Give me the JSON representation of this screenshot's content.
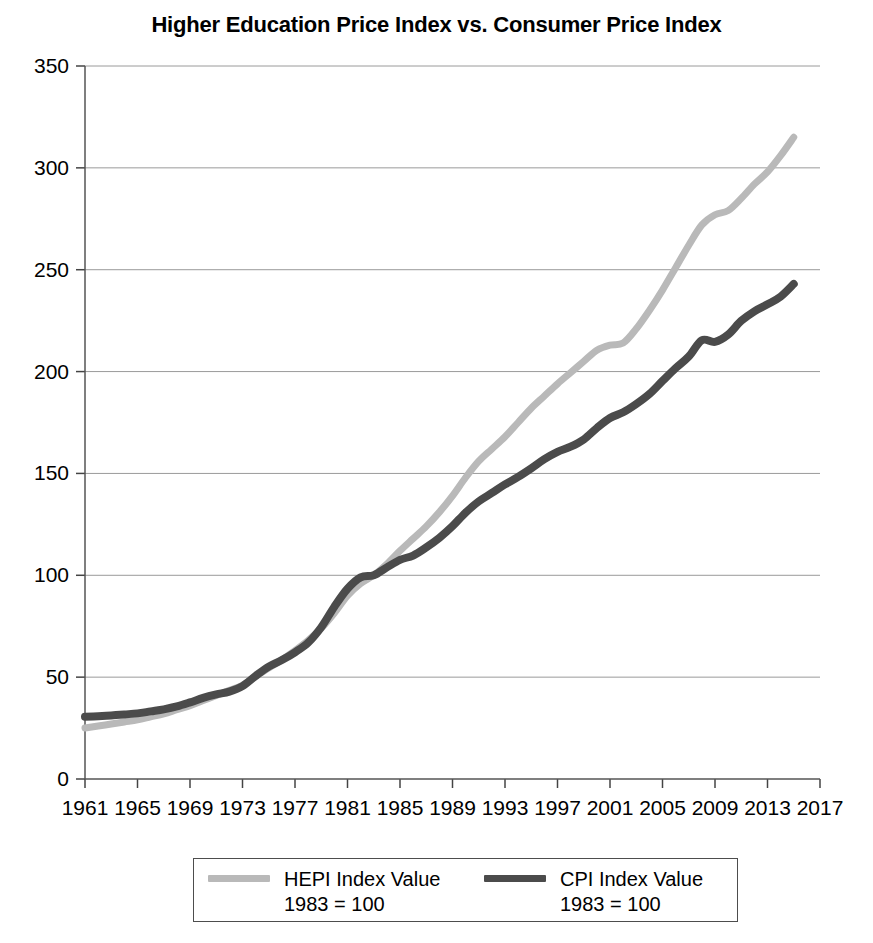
{
  "chart_data": {
    "type": "line",
    "title": "Higher Education Price Index vs. Consumer Price Index",
    "xlabel": "",
    "ylabel": "",
    "xlim": [
      1961,
      2017
    ],
    "ylim": [
      0,
      350
    ],
    "grid": true,
    "legend_position": "bottom",
    "ytick_labels": [
      "0",
      "50",
      "100",
      "150",
      "200",
      "250",
      "300",
      "350"
    ],
    "ytick_values": [
      0,
      50,
      100,
      150,
      200,
      250,
      300,
      350
    ],
    "xtick_labels": [
      "1961",
      "1965",
      "1969",
      "1973",
      "1977",
      "1981",
      "1985",
      "1989",
      "1993",
      "1997",
      "2001",
      "2005",
      "2009",
      "2013",
      "2017"
    ],
    "xtick_values": [
      1961,
      1965,
      1969,
      1973,
      1977,
      1981,
      1985,
      1989,
      1993,
      1997,
      2001,
      2005,
      2009,
      2013,
      2017
    ],
    "x": [
      1961,
      1962,
      1963,
      1964,
      1965,
      1966,
      1967,
      1968,
      1969,
      1970,
      1971,
      1972,
      1973,
      1974,
      1975,
      1976,
      1977,
      1978,
      1979,
      1980,
      1981,
      1982,
      1983,
      1984,
      1985,
      1986,
      1987,
      1988,
      1989,
      1990,
      1991,
      1992,
      1993,
      1994,
      1995,
      1996,
      1997,
      1998,
      1999,
      2000,
      2001,
      2002,
      2003,
      2004,
      2005,
      2006,
      2007,
      2008,
      2009,
      2010,
      2011,
      2012,
      2013,
      2014,
      2015
    ],
    "series": [
      {
        "name": "HEPI Index Value",
        "sublabel": "1983 = 100",
        "color": "#b9b9b9",
        "values": [
          25.0,
          26.0,
          27.0,
          28.0,
          29.0,
          30.5,
          32.0,
          34.0,
          36.0,
          38.5,
          41.0,
          43.5,
          46.0,
          50.5,
          54.5,
          58.5,
          63.0,
          68.0,
          74.0,
          81.5,
          90.0,
          96.0,
          100.0,
          105.5,
          112.0,
          118.0,
          124.0,
          131.0,
          139.0,
          148.0,
          156.0,
          162.0,
          168.0,
          175.0,
          182.0,
          188.0,
          194.0,
          199.5,
          205.0,
          210.5,
          213.0,
          214.0,
          221.0,
          230.0,
          240.0,
          251.0,
          262.0,
          272.0,
          277.0,
          279.0,
          285.0,
          292.0,
          298.0,
          306.0,
          315.0
        ]
      },
      {
        "name": "CPI Index Value",
        "sublabel": "1983 = 100",
        "color": "#4b4b4b",
        "values": [
          30.5,
          30.8,
          31.2,
          31.7,
          32.2,
          33.2,
          34.2,
          35.6,
          37.6,
          39.8,
          41.5,
          42.9,
          45.6,
          50.6,
          55.2,
          58.4,
          62.2,
          66.9,
          74.5,
          84.6,
          93.4,
          99.0,
          100.0,
          103.9,
          107.6,
          109.7,
          113.7,
          118.4,
          124.1,
          130.8,
          136.3,
          140.4,
          144.6,
          148.3,
          152.5,
          157.0,
          160.6,
          163.1,
          166.7,
          172.3,
          177.2,
          180.0,
          184.1,
          189.0,
          195.4,
          201.7,
          207.4,
          215.4,
          214.6,
          218.1,
          224.9,
          229.6,
          233.0,
          236.8,
          243.0
        ]
      }
    ]
  },
  "legend": {
    "entries": [
      {
        "label": "HEPI Index Value",
        "sublabel": "1983 = 100"
      },
      {
        "label": "CPI Index Value",
        "sublabel": "1983 = 100"
      }
    ]
  }
}
